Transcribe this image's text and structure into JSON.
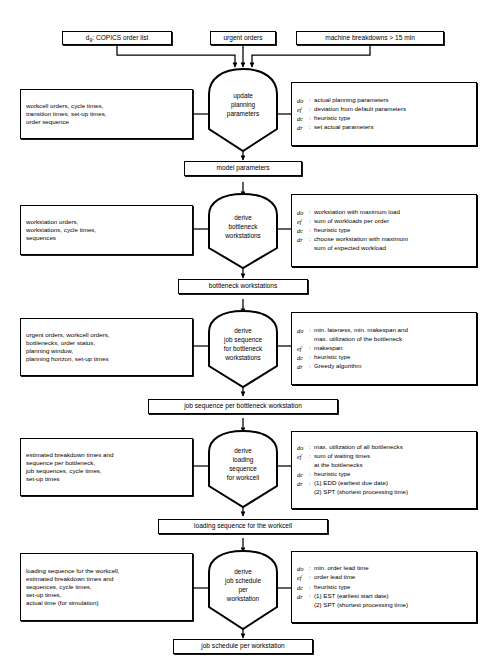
{
  "diagram": {
    "caption": "",
    "legend_keys": [
      "do",
      "ef",
      "dc",
      "dr"
    ],
    "colors": {
      "line": "#000000",
      "background": "#ffffff",
      "text": "#000000"
    }
  },
  "top_inputs": [
    {
      "id": "copics",
      "prefix": "d",
      "subscript": "g",
      "text": ": COPICS order list"
    },
    {
      "id": "urgent",
      "text": "urgent orders"
    },
    {
      "id": "breakdowns",
      "text": "machine breakdowns > 15 min"
    }
  ],
  "stages": [
    {
      "id": "stage-1",
      "process": [
        "update",
        "planning",
        "parameters"
      ],
      "inputs": [
        "workcell orders, cycle times,",
        "transition times, set-up times,",
        "order sequence"
      ],
      "annotations": [
        {
          "key": "do",
          "lines": [
            "actual planning parameters"
          ]
        },
        {
          "key": "ef",
          "lines": [
            "deviation from default parameters"
          ]
        },
        {
          "key": "dc",
          "lines": [
            "heuristic type"
          ]
        },
        {
          "key": "dr",
          "lines": [
            "set actual parameters"
          ]
        }
      ],
      "output": "model parameters"
    },
    {
      "id": "stage-2",
      "process": [
        "derive",
        "bottleneck",
        "workstations"
      ],
      "inputs": [
        "workstation orders,",
        "workstations, cycle times,",
        "sequences"
      ],
      "annotations": [
        {
          "key": "do",
          "lines": [
            "workstation with maximum load"
          ]
        },
        {
          "key": "ef",
          "lines": [
            "sum of workloads per order"
          ]
        },
        {
          "key": "dc",
          "lines": [
            "heuristic type"
          ]
        },
        {
          "key": "dr",
          "lines": [
            "choose workstation with maximum",
            "sum of expected workload"
          ]
        }
      ],
      "output": "bottleneck workstations"
    },
    {
      "id": "stage-3",
      "process": [
        "derive",
        "job sequence",
        "for bottleneck",
        "workstations"
      ],
      "inputs": [
        "urgent orders, workcell orders,",
        "bottlenecks, order status,",
        "planning window,",
        "planning horizon, set-up times"
      ],
      "annotations": [
        {
          "key": "do",
          "lines": [
            "min. lateness, min. makespan and",
            "max. utilization of  the bottleneck"
          ]
        },
        {
          "key": "ef",
          "lines": [
            "makespan"
          ]
        },
        {
          "key": "dc",
          "lines": [
            "heuristic type"
          ]
        },
        {
          "key": "dr",
          "lines": [
            "Greedy algorithm"
          ]
        }
      ],
      "output": "job sequence per bottleneck workstation"
    },
    {
      "id": "stage-4",
      "process": [
        "derive",
        "loading",
        "sequence",
        "for workcell"
      ],
      "inputs": [
        "estimated breakdown times and",
        "sequence per bottleneck,",
        "job sequences, cycle times,",
        "set-up times"
      ],
      "annotations": [
        {
          "key": "do",
          "lines": [
            "max. utilization of all bottlenecks"
          ]
        },
        {
          "key": "ef",
          "lines": [
            "sum of waiting times",
            "at the bottlenecks"
          ]
        },
        {
          "key": "dc",
          "lines": [
            "heuristic type"
          ]
        },
        {
          "key": "dr",
          "lines": [
            "(1) EDD (earliest due date)",
            "(2) SPT (shortest processing time)"
          ]
        }
      ],
      "output": "loading sequence for the workcell"
    },
    {
      "id": "stage-5",
      "process": [
        "derive",
        "job schedule",
        "per",
        "workstation"
      ],
      "inputs": [
        "loading sequence for the workcell,",
        "estimated breakdown times and",
        "sequences, cycle times,",
        "set-up times,",
        "actual time (for simulation)"
      ],
      "annotations": [
        {
          "key": "do",
          "lines": [
            "min. order lead time"
          ]
        },
        {
          "key": "ef",
          "lines": [
            "order lead time"
          ]
        },
        {
          "key": "dc",
          "lines": [
            "heuristic type"
          ]
        },
        {
          "key": "dr",
          "lines": [
            "(1) EST (earliest start date)",
            "(2) SPT (shortest processing time)"
          ]
        }
      ],
      "output": "job schedule per workstation"
    }
  ]
}
